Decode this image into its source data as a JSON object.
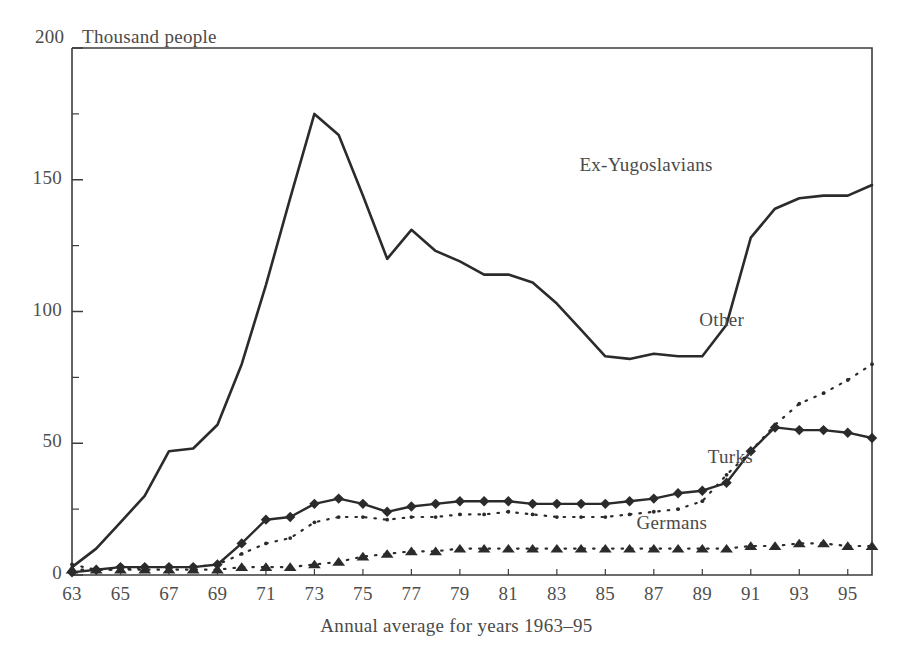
{
  "chart_data": {
    "type": "line",
    "title": "",
    "ylabel": "Thousand people",
    "xlabel": "Annual average for years 1963–95",
    "ylim": [
      0,
      200
    ],
    "yticks": [
      "0",
      "50",
      "100",
      "150",
      "200"
    ],
    "ytick_values": [
      0,
      50,
      100,
      150,
      200
    ],
    "yminor_values": [
      25,
      75,
      125,
      175
    ],
    "grid": false,
    "legend_position": "inline-right",
    "x": [
      1963,
      1964,
      1965,
      1966,
      1967,
      1968,
      1969,
      1970,
      1971,
      1972,
      1973,
      1974,
      1975,
      1976,
      1977,
      1978,
      1979,
      1980,
      1981,
      1982,
      1983,
      1984,
      1985,
      1986,
      1987,
      1988,
      1989,
      1990,
      1991,
      1992,
      1993,
      1994,
      1995,
      1996
    ],
    "xticks": [
      "63",
      "65",
      "67",
      "69",
      "71",
      "73",
      "75",
      "77",
      "79",
      "81",
      "83",
      "85",
      "87",
      "89",
      "91",
      "93",
      "95"
    ],
    "xtick_values": [
      1963,
      1965,
      1967,
      1969,
      1971,
      1973,
      1975,
      1977,
      1979,
      1981,
      1983,
      1985,
      1987,
      1989,
      1991,
      1993,
      1995
    ],
    "xlim": [
      1963,
      1996
    ],
    "series": [
      {
        "name": "Ex-Yugoslavians",
        "style": "solid-line",
        "marker": "none",
        "color": "#2b2b2b",
        "label_x": 1990.2,
        "label_y": 155,
        "values": [
          3,
          10,
          20,
          30,
          47,
          48,
          57,
          80,
          110,
          143,
          175,
          167,
          144,
          120,
          131,
          123,
          119,
          114,
          114,
          111,
          103,
          93,
          83,
          82,
          84,
          83,
          83,
          95,
          128,
          139,
          143,
          144,
          144,
          148
        ]
      },
      {
        "name": "Other",
        "style": "dotted",
        "marker": "dot",
        "color": "#2b2b2b",
        "label_x": 1991.6,
        "label_y": 96,
        "values": [
          4,
          2,
          2,
          3,
          3,
          3,
          4,
          8,
          12,
          14,
          20,
          22,
          22,
          21,
          22,
          22,
          23,
          23,
          24,
          23,
          22,
          22,
          22,
          23,
          24,
          25,
          28,
          38,
          47,
          57,
          65,
          69,
          74,
          80
        ]
      },
      {
        "name": "Turks",
        "style": "solid-line",
        "marker": "diamond",
        "color": "#2b2b2b",
        "label_x": 1991.7,
        "label_y": 44,
        "values": [
          1,
          2,
          3,
          3,
          3,
          3,
          4,
          12,
          21,
          22,
          27,
          29,
          27,
          24,
          26,
          27,
          28,
          28,
          28,
          27,
          27,
          27,
          27,
          28,
          29,
          31,
          32,
          35,
          47,
          56,
          55,
          55,
          54,
          52
        ]
      },
      {
        "name": "Germans",
        "style": "dotted",
        "marker": "triangle",
        "color": "#2b2b2b",
        "label_x": 1990.0,
        "label_y": 19,
        "values": [
          2,
          2,
          2,
          2,
          2,
          2,
          2,
          3,
          3,
          3,
          4,
          5,
          7,
          8,
          9,
          9,
          10,
          10,
          10,
          10,
          10,
          10,
          10,
          10,
          10,
          10,
          10,
          10,
          11,
          11,
          12,
          12,
          11,
          11
        ]
      }
    ]
  },
  "axis": {
    "y_top_label": "200",
    "y_title": "Thousand people"
  }
}
